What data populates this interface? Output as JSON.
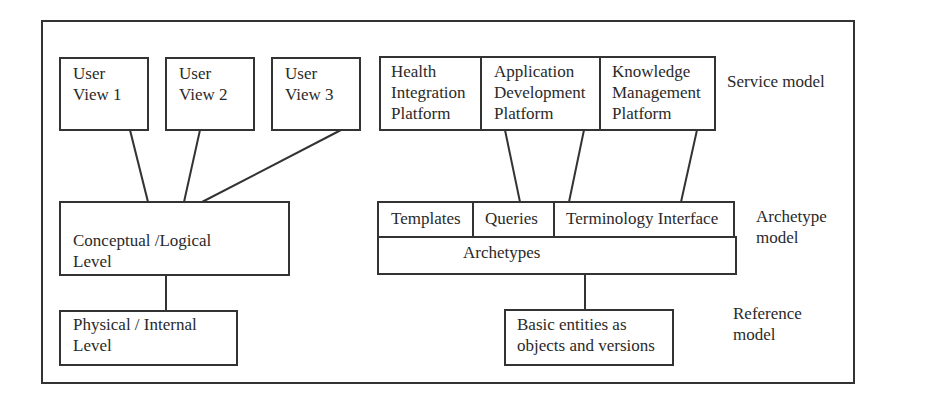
{
  "user_views": [
    {
      "line1": "User",
      "line2": "View 1"
    },
    {
      "line1": "User",
      "line2": "View 2"
    },
    {
      "line1": "User",
      "line2": "View 3"
    }
  ],
  "conceptual": {
    "line1": "Conceptual /Logical",
    "line2": "Level"
  },
  "physical": {
    "line1": "Physical / Internal",
    "line2": "Level"
  },
  "service_platforms": [
    {
      "line1": "Health",
      "line2": "Integration",
      "line3": "Platform"
    },
    {
      "line1": "Application",
      "line2": "Development",
      "line3": "Platform"
    },
    {
      "line1": "Knowledge",
      "line2": "Management",
      "line3": "Platform"
    }
  ],
  "archetype_row": {
    "templates": "Templates",
    "queries": "Queries",
    "terminology": "Terminology Interface"
  },
  "archetypes": "Archetypes",
  "basic_entities": {
    "line1": "Basic entities as",
    "line2": "objects and versions"
  },
  "layer_labels": {
    "service": "Service model",
    "archetype_line1": "Archetype",
    "archetype_line2": "model",
    "reference_line1": "Reference",
    "reference_line2": "model"
  }
}
